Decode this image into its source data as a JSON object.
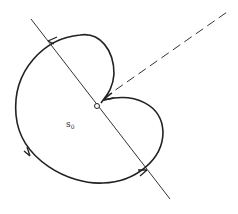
{
  "diagram": {
    "type": "contour-diagram",
    "labels": {
      "region_label": "s",
      "region_label_subscript": "0"
    },
    "elements": [
      {
        "name": "straight-line",
        "style": "solid"
      },
      {
        "name": "dashed-ray",
        "style": "dashed"
      },
      {
        "name": "closed-contour",
        "style": "solid",
        "arrows": 4
      },
      {
        "name": "origin-point",
        "style": "open-circle"
      }
    ],
    "colors": {
      "stroke": "#222222",
      "background": "#ffffff"
    }
  }
}
